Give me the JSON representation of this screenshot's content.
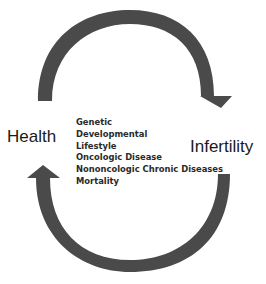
{
  "diagram": {
    "nodes": [
      {
        "id": "health",
        "label": "Health"
      },
      {
        "id": "infertility",
        "label": "Infertility"
      }
    ],
    "factors": [
      "Genetic",
      "Developmental",
      "Lifestyle",
      "Oncologic Disease",
      "Nononcologic Chronic Diseases",
      "Mortality"
    ],
    "edges": [
      {
        "from": "health",
        "to": "infertility",
        "style": "curved-arrow-top"
      },
      {
        "from": "infertility",
        "to": "health",
        "style": "curved-arrow-bottom"
      }
    ],
    "colors": {
      "arrow": "#4a4a4a",
      "text": "#1a1a1a"
    }
  }
}
